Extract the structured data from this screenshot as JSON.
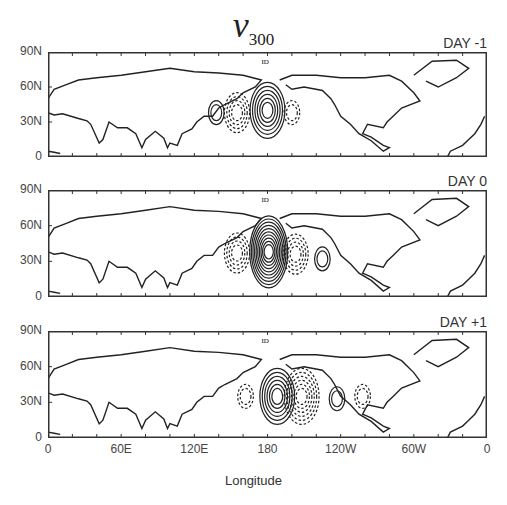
{
  "title": {
    "variable": "v",
    "subscript": "300"
  },
  "panels": [
    {
      "label": "DAY -1"
    },
    {
      "label": "DAY 0"
    },
    {
      "label": "DAY +1"
    }
  ],
  "y_ticks": [
    "90N",
    "60N",
    "30N",
    "0"
  ],
  "x_ticks": [
    "0",
    "60E",
    "120E",
    "180",
    "120W",
    "60W",
    "0"
  ],
  "x_axis_title": "Longitude",
  "map_marker": "ID",
  "legend": {
    "solid": "positive (southerly) v",
    "dashed": "negative (northerly) v"
  },
  "chart_data": {
    "type": "contour-map",
    "title": "v300",
    "xlabel": "Longitude",
    "ylabel": "",
    "xlim": [
      "0",
      "0 (360)"
    ],
    "ylim": [
      "0",
      "90N"
    ],
    "x_tick_labels": [
      "0",
      "60E",
      "120E",
      "180",
      "120W",
      "60W",
      "0"
    ],
    "y_tick_labels": [
      "0",
      "30N",
      "60N",
      "90N"
    ],
    "panels": [
      {
        "label": "DAY -1",
        "centers": [
          {
            "sign": "+",
            "lon": 138,
            "lat": 38,
            "strength": "weak"
          },
          {
            "sign": "-",
            "lon": 155,
            "lat": 38,
            "strength": "moderate"
          },
          {
            "sign": "+",
            "lon": 180,
            "lat": 40,
            "strength": "strong"
          },
          {
            "sign": "-",
            "lon": 200,
            "lat": 38,
            "strength": "weak"
          }
        ]
      },
      {
        "label": "DAY 0",
        "centers": [
          {
            "sign": "-",
            "lon": 155,
            "lat": 37,
            "strength": "moderate"
          },
          {
            "sign": "+",
            "lon": 181,
            "lat": 38,
            "strength": "very strong"
          },
          {
            "sign": "-",
            "lon": 203,
            "lat": 36,
            "strength": "moderate"
          },
          {
            "sign": "+",
            "lon": 225,
            "lat": 32,
            "strength": "weak"
          }
        ]
      },
      {
        "label": "DAY +1",
        "centers": [
          {
            "sign": "-",
            "lon": 162,
            "lat": 35,
            "strength": "weak"
          },
          {
            "sign": "+",
            "lon": 188,
            "lat": 35,
            "strength": "strong"
          },
          {
            "sign": "-",
            "lon": 208,
            "lat": 35,
            "strength": "strong"
          },
          {
            "sign": "+",
            "lon": 237,
            "lat": 33,
            "strength": "weak"
          },
          {
            "sign": "-",
            "lon": 258,
            "lat": 35,
            "strength": "weak"
          }
        ]
      }
    ]
  }
}
